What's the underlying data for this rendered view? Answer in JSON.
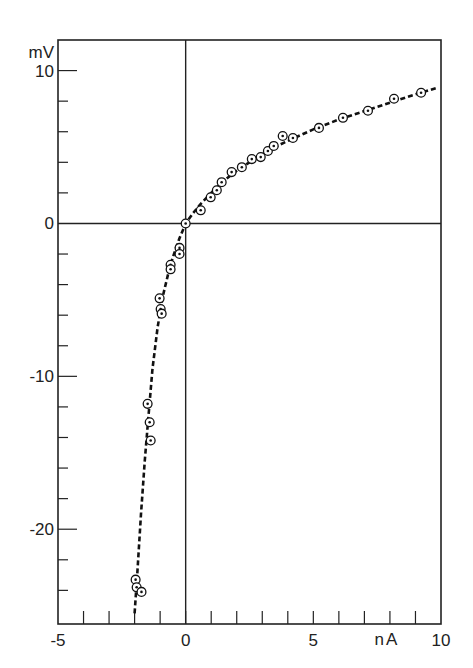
{
  "chart_data": {
    "type": "scatter",
    "title": "",
    "xlabel": "nA",
    "ylabel": "mV",
    "xlim": [
      -5,
      10
    ],
    "ylim": [
      -26.2,
      12.0
    ],
    "x_ticks_major": [
      -5,
      0,
      5,
      10
    ],
    "x_tick_labels": [
      "-5",
      "0",
      "5",
      "10"
    ],
    "x_ticks_minor": [
      -4,
      -3,
      -2,
      -1,
      1,
      2,
      3,
      4,
      6,
      7,
      8,
      9
    ],
    "y_ticks_major": [
      10,
      0,
      -10,
      -20
    ],
    "y_tick_labels": [
      "10",
      "0",
      "-10",
      "-20"
    ],
    "y_ticks_minor": [
      8,
      6,
      4,
      2,
      -2,
      -4,
      -6,
      -8,
      -12,
      -14,
      -16,
      -18,
      -22,
      -24
    ],
    "grid": false,
    "zero_lines": true,
    "legend": null,
    "series": [
      {
        "name": "measured points",
        "marker": "circle-dot",
        "points": [
          [
            -1.96,
            -23.3
          ],
          [
            -1.92,
            -23.8
          ],
          [
            -1.73,
            -24.1
          ],
          [
            -1.49,
            -11.8
          ],
          [
            -1.41,
            -13.0
          ],
          [
            -1.37,
            -14.2
          ],
          [
            -1.02,
            -4.9
          ],
          [
            -0.98,
            -5.6
          ],
          [
            -0.94,
            -5.9
          ],
          [
            -0.59,
            -2.7
          ],
          [
            -0.59,
            -3.0
          ],
          [
            -0.24,
            -1.6
          ],
          [
            -0.24,
            -2.0
          ],
          [
            0.0,
            0.0
          ],
          [
            0.59,
            0.86
          ],
          [
            0.98,
            1.71
          ],
          [
            1.22,
            2.17
          ],
          [
            1.41,
            2.7
          ],
          [
            1.8,
            3.36
          ],
          [
            2.2,
            3.68
          ],
          [
            2.59,
            4.21
          ],
          [
            2.94,
            4.34
          ],
          [
            3.22,
            4.74
          ],
          [
            3.45,
            5.07
          ],
          [
            3.8,
            5.72
          ],
          [
            4.2,
            5.59
          ],
          [
            5.22,
            6.25
          ],
          [
            6.16,
            6.91
          ],
          [
            7.14,
            7.37
          ],
          [
            8.16,
            8.16
          ],
          [
            9.22,
            8.55
          ]
        ]
      },
      {
        "name": "fitted curve",
        "style": "dashed",
        "points": [
          [
            -2.0,
            -25.5
          ],
          [
            -1.9,
            -23.0
          ],
          [
            -1.75,
            -19.0
          ],
          [
            -1.6,
            -15.5
          ],
          [
            -1.45,
            -12.5
          ],
          [
            -1.3,
            -9.5
          ],
          [
            -1.1,
            -6.8
          ],
          [
            -0.9,
            -4.8
          ],
          [
            -0.7,
            -3.4
          ],
          [
            -0.5,
            -2.2
          ],
          [
            -0.25,
            -1.0
          ],
          [
            0.0,
            0.0
          ],
          [
            0.3,
            0.7
          ],
          [
            0.6,
            1.3
          ],
          [
            1.0,
            2.0
          ],
          [
            1.5,
            2.8
          ],
          [
            2.0,
            3.45
          ],
          [
            2.5,
            4.0
          ],
          [
            3.0,
            4.5
          ],
          [
            3.5,
            5.0
          ],
          [
            4.0,
            5.4
          ],
          [
            5.0,
            6.15
          ],
          [
            6.0,
            6.8
          ],
          [
            7.0,
            7.35
          ],
          [
            8.0,
            7.9
          ],
          [
            9.0,
            8.45
          ],
          [
            9.8,
            8.85
          ]
        ]
      }
    ]
  },
  "axes": {
    "y_unit": "mV",
    "x_unit": "nA"
  }
}
